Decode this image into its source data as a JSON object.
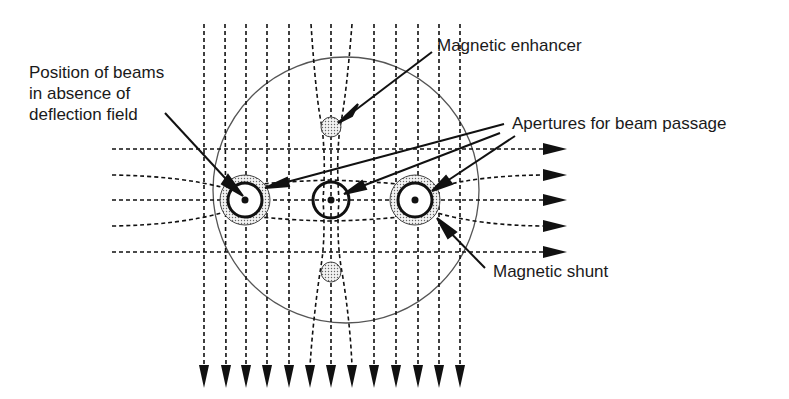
{
  "diagram": {
    "labels": {
      "beam_position": [
        "Position of beams",
        "in absence of",
        "deflection field"
      ],
      "magnetic_enhancer": "Magnetic enhancer",
      "apertures": "Apertures for beam passage",
      "magnetic_shunt": "Magnetic shunt"
    },
    "colors": {
      "line": "#1a1a1a",
      "circle": "#555555",
      "stipple": "#d0d0d0",
      "background": "#ffffff"
    },
    "components": {
      "outer_circle": {
        "cx": 346,
        "cy": 190,
        "r": 133
      },
      "beams": [
        {
          "name": "left-beam",
          "cx": 245,
          "cy": 200,
          "shunt": true
        },
        {
          "name": "center-beam",
          "cx": 331,
          "cy": 200,
          "shunt": false
        },
        {
          "name": "right-beam",
          "cx": 415,
          "cy": 200,
          "shunt": true
        }
      ],
      "enhancers": [
        {
          "name": "top-enhancer",
          "cx": 331,
          "cy": 127
        },
        {
          "name": "bottom-enhancer",
          "cx": 331,
          "cy": 272
        }
      ],
      "vertical_field_lines_x": [
        204,
        225,
        246,
        267,
        289,
        310,
        331,
        352,
        374,
        396,
        418,
        439,
        460
      ],
      "horizontal_field_lines_y": [
        149,
        175,
        200,
        226,
        252
      ]
    }
  }
}
